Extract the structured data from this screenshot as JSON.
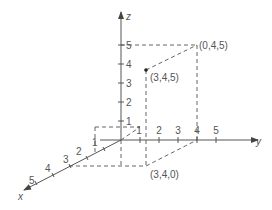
{
  "diagram": {
    "type": "3d-coordinate-axes",
    "axes": {
      "x": {
        "label": "x",
        "ticks": [
          "1",
          "2",
          "3",
          "4",
          "5"
        ]
      },
      "y": {
        "label": "y",
        "ticks": [
          "1",
          "2",
          "3",
          "4",
          "5"
        ]
      },
      "z": {
        "label": "z",
        "ticks": [
          "1",
          "2",
          "3",
          "4",
          "5"
        ]
      }
    },
    "points": [
      {
        "label": "(3,4,5)",
        "coords": [
          3,
          4,
          5
        ]
      },
      {
        "label": "(0,4,5)",
        "coords": [
          0,
          4,
          5
        ]
      },
      {
        "label": "(3,4,0)",
        "coords": [
          3,
          4,
          0
        ]
      }
    ],
    "colors": {
      "line": "#555555",
      "text": "#555555"
    }
  }
}
